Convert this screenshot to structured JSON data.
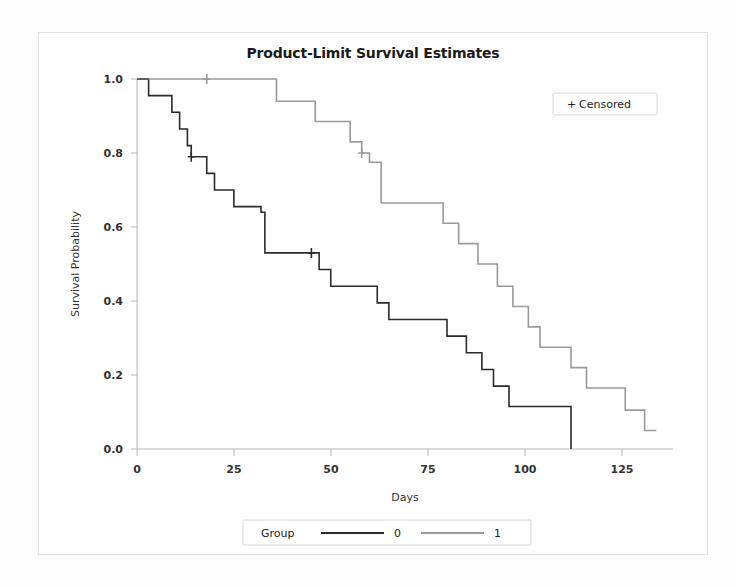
{
  "chart_data": {
    "type": "line",
    "subtype": "kaplan-meier-step",
    "title": "Product-Limit Survival Estimates",
    "xlabel": "Days",
    "ylabel": "Survival Probability",
    "xlim": [
      0,
      136
    ],
    "ylim": [
      0.0,
      1.0
    ],
    "xticks": [
      0,
      25,
      50,
      75,
      100,
      125
    ],
    "xtick_labels": [
      "0",
      "25",
      "50",
      "75",
      "100",
      "125"
    ],
    "yticks": [
      0.0,
      0.2,
      0.4,
      0.6,
      0.8,
      1.0
    ],
    "ytick_labels": [
      "0.0",
      "0.2",
      "0.4",
      "0.6",
      "0.8",
      "1.0"
    ],
    "grid": false,
    "legend_position": "bottom",
    "censored_legend": {
      "label": "Censored",
      "marker": "+",
      "position": "top-right"
    },
    "group_legend": {
      "title": "Group",
      "entries": [
        {
          "label": "0",
          "color": "#2b2b2b"
        },
        {
          "label": "1",
          "color": "#9a9a9a"
        }
      ]
    },
    "series": [
      {
        "name": "0",
        "color": "#2b2b2b",
        "width": 1.6,
        "points": [
          [
            0,
            1.0
          ],
          [
            3,
            0.955
          ],
          [
            9,
            0.91
          ],
          [
            11,
            0.865
          ],
          [
            13,
            0.82
          ],
          [
            14,
            0.79
          ],
          [
            18,
            0.745
          ],
          [
            20,
            0.7
          ],
          [
            23,
            0.7
          ],
          [
            25,
            0.655
          ],
          [
            32,
            0.64
          ],
          [
            33,
            0.53
          ],
          [
            45,
            0.53
          ],
          [
            47,
            0.485
          ],
          [
            50,
            0.44
          ],
          [
            58,
            0.44
          ],
          [
            62,
            0.395
          ],
          [
            65,
            0.35
          ],
          [
            77,
            0.35
          ],
          [
            80,
            0.305
          ],
          [
            85,
            0.26
          ],
          [
            89,
            0.215
          ],
          [
            92,
            0.17
          ],
          [
            96,
            0.115
          ],
          [
            112,
            0.115
          ],
          [
            112,
            0.0
          ]
        ],
        "censored": [
          [
            14,
            0.79
          ],
          [
            45,
            0.53
          ]
        ]
      },
      {
        "name": "1",
        "color": "#9a9a9a",
        "width": 1.6,
        "points": [
          [
            3,
            1.0
          ],
          [
            18,
            1.0
          ],
          [
            33,
            1.0
          ],
          [
            36,
            0.94
          ],
          [
            44,
            0.94
          ],
          [
            46,
            0.885
          ],
          [
            52,
            0.885
          ],
          [
            55,
            0.83
          ],
          [
            58,
            0.8
          ],
          [
            60,
            0.775
          ],
          [
            63,
            0.665
          ],
          [
            77,
            0.665
          ],
          [
            79,
            0.61
          ],
          [
            83,
            0.555
          ],
          [
            88,
            0.5
          ],
          [
            93,
            0.44
          ],
          [
            97,
            0.385
          ],
          [
            101,
            0.33
          ],
          [
            104,
            0.275
          ],
          [
            112,
            0.22
          ],
          [
            116,
            0.165
          ],
          [
            124,
            0.165
          ],
          [
            126,
            0.105
          ],
          [
            131,
            0.05
          ],
          [
            134,
            0.05
          ]
        ],
        "censored": [
          [
            18,
            1.0
          ],
          [
            58,
            0.8
          ]
        ]
      }
    ]
  }
}
